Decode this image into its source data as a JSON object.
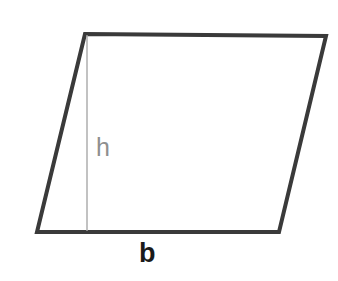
{
  "figure": {
    "name": "parallelogram-with-base-and-height",
    "background_color": "#ffffff",
    "outline_color": "#3a3a3a",
    "outline_width": 4,
    "height_line_color": "#a8a8a8",
    "height_line_width": 1.4,
    "vertices": {
      "top_left": [
        85,
        34
      ],
      "top_right": [
        326,
        36
      ],
      "bottom_right": [
        279,
        232
      ],
      "bottom_left": [
        37,
        232
      ]
    },
    "height_segment": {
      "x": 87,
      "y_top": 35,
      "y_bottom": 231
    },
    "labels": {
      "height": {
        "text": "h",
        "color": "#8f8f8f",
        "x": 104,
        "y": 148
      },
      "base": {
        "text": "b",
        "color": "#1a1a1a",
        "x": 148,
        "y": 254
      }
    }
  }
}
